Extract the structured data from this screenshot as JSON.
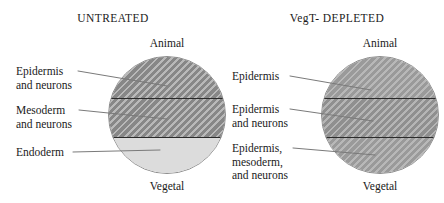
{
  "figure": {
    "panels": [
      {
        "title": "UNTREATED",
        "animal_label": "Animal",
        "vegetal_label": "Vegetal",
        "regions": [
          {
            "label": "Epidermis\nand neurons",
            "fill": "hatch-dark"
          },
          {
            "label": "Mesoderm\nand neurons",
            "fill": "hatch-dark"
          },
          {
            "label": "Endoderm",
            "fill": "plain-light"
          }
        ]
      },
      {
        "title": "VegT- DEPLETED",
        "animal_label": "Animal",
        "vegetal_label": "Vegetal",
        "regions": [
          {
            "label": "Epidermis",
            "fill": "hatch-light"
          },
          {
            "label": "Epidermis\nand neurons",
            "fill": "hatch-mid"
          },
          {
            "label": "Epidermis,\nmesoderm,\nand neurons",
            "fill": "hatch-light"
          }
        ]
      }
    ],
    "colors": {
      "hatch_dark": "#878787",
      "hatch_mid": "#8f8f8f",
      "hatch_light": "#9a9a9a",
      "plain_light": "#dcdcdc",
      "divider": "#2b2b2b",
      "outline": "#8c8c8c",
      "leader_line": "#7a7a7a",
      "text": "#1a1a1a"
    }
  }
}
